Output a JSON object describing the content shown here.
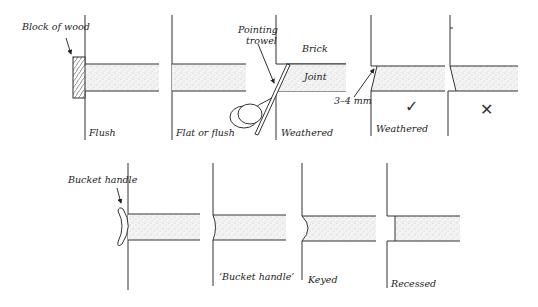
{
  "diagram": {
    "top_row": [
      {
        "id": "flush",
        "caption": "Flush",
        "callout": "Block of wood"
      },
      {
        "id": "flat-or-flush",
        "caption": "Flat or flush",
        "callout": "Pointing trowel"
      },
      {
        "id": "weathered-trowel",
        "caption": "Weathered",
        "labels": {
          "brick": "Brick",
          "joint": "Joint"
        }
      },
      {
        "id": "weathered-correct",
        "caption": "Weathered",
        "dimension": "3–4 mm",
        "mark": "✓"
      },
      {
        "id": "weathered-incorrect",
        "caption": "",
        "mark": "✕"
      }
    ],
    "bottom_row": [
      {
        "id": "bucket-handle-tool",
        "caption": "",
        "callout": "Bucket handle"
      },
      {
        "id": "bucket-handle",
        "caption": "‘Bucket handle’"
      },
      {
        "id": "keyed",
        "caption": "Keyed"
      },
      {
        "id": "recessed",
        "caption": "Recessed"
      }
    ]
  }
}
